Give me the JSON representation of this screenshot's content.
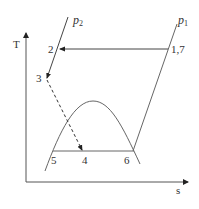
{
  "diagram": {
    "type": "T-s diagram",
    "axes": {
      "y_label": "T",
      "x_label": "s"
    },
    "pressure_lines": [
      {
        "name": "p",
        "subscript": "2"
      },
      {
        "name": "p",
        "subscript": "1"
      }
    ],
    "points": [
      {
        "label": "1,7"
      },
      {
        "label": "2"
      },
      {
        "label": "3"
      },
      {
        "label": "4"
      },
      {
        "label": "5"
      },
      {
        "label": "6"
      }
    ],
    "processes": [
      {
        "from": "1,7",
        "to": "2",
        "style": "solid-arrow"
      },
      {
        "from": "2",
        "to": "3",
        "style": "solid-arrow",
        "along": "p2"
      },
      {
        "from": "3",
        "to": "4",
        "style": "dashed-arrow"
      },
      {
        "from": "5",
        "to": "6",
        "style": "solid"
      }
    ],
    "colors": {
      "line": "#555555",
      "text": "#333333",
      "background": "#ffffff"
    }
  }
}
